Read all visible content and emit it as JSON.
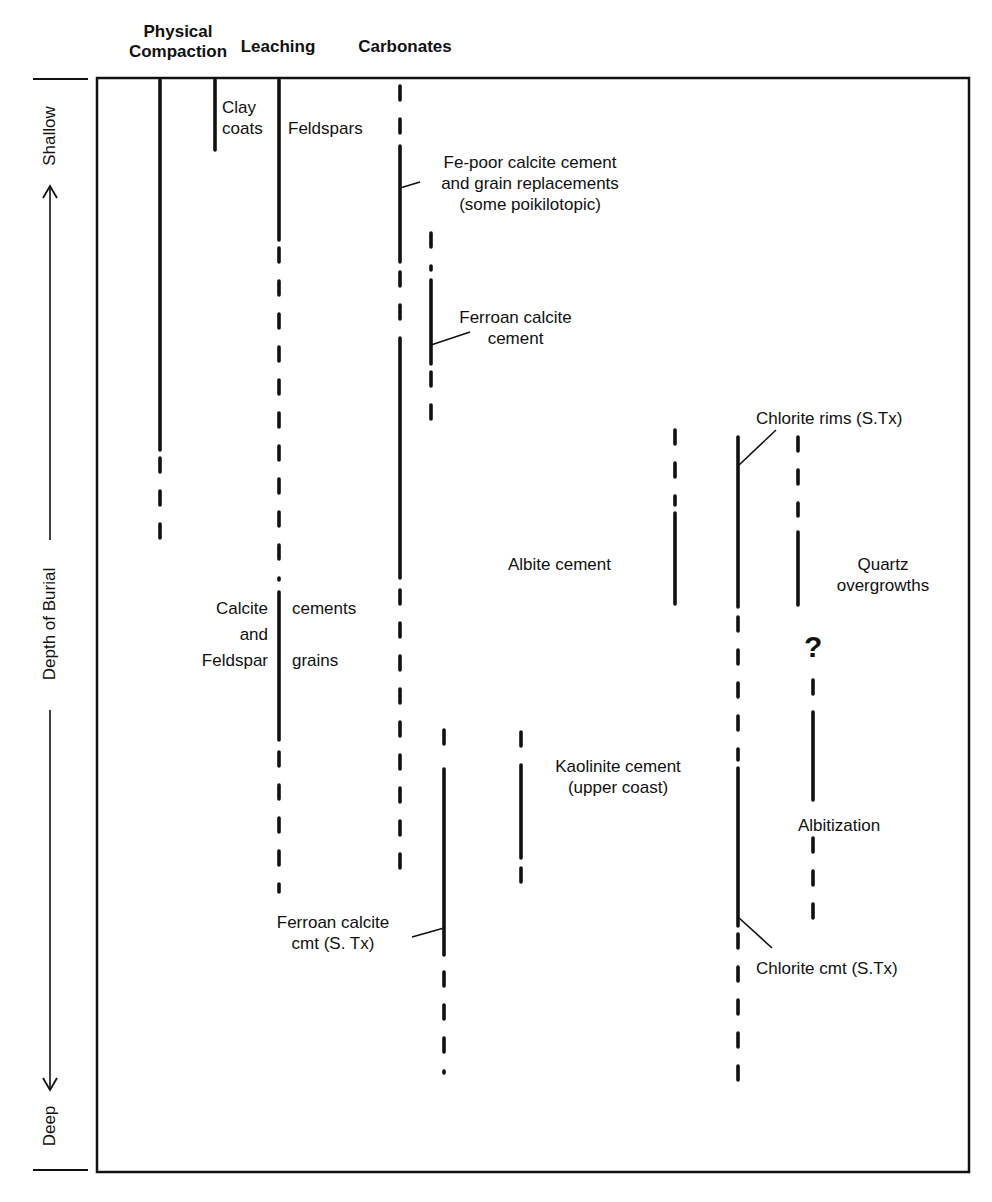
{
  "diagram": {
    "type": "diagenetic-sequence",
    "frame": {
      "x": 97,
      "y": 78,
      "width": 872,
      "height": 1094
    },
    "column_headers": [
      {
        "id": "physical-compaction",
        "lines": [
          "Physical",
          "Compaction"
        ],
        "x": 160
      },
      {
        "id": "leaching",
        "lines": [
          "Leaching"
        ],
        "x": 279
      },
      {
        "id": "carbonates",
        "lines": [
          "Carbonates"
        ],
        "x": 400
      }
    ],
    "axis": {
      "label": "Depth of Burial",
      "top_label": "Shallow",
      "bottom_label": "Deep",
      "direction": "increasing downward"
    },
    "labels": {
      "clay_coats": [
        "Clay",
        "coats"
      ],
      "feldspars": "Feldspars",
      "fe_poor_calcite": [
        "Fe-poor calcite cement",
        "and grain replacements",
        "(some poikilotopic)"
      ],
      "ferroan_calcite_cement": [
        "Ferroan calcite",
        "cement"
      ],
      "chlorite_rims": "Chlorite rims (S.Tx)",
      "albite_cement": "Albite cement",
      "quartz_overgrowths": [
        "Quartz",
        "overgrowths"
      ],
      "calcite_left": [
        "Calcite",
        "and",
        "Feldspar"
      ],
      "calcite_right": [
        "cements",
        "",
        "grains"
      ],
      "question_mark": "?",
      "kaolinite_cement": [
        "Kaolinite cement",
        "(upper coast)"
      ],
      "albitization": "Albitization",
      "ferroan_calcite_cmt": [
        "Ferroan calcite",
        "cmt (S. Tx)"
      ],
      "chlorite_cmt": "Chlorite cmt (S.Tx)"
    },
    "legend_convention": {
      "solid": "process well established",
      "dashed": "process uncertain / minor"
    },
    "processes": [
      {
        "name": "Physical Compaction",
        "x": 160,
        "segments": [
          {
            "y1": 80,
            "y2": 450,
            "style": "solid"
          },
          {
            "y1": 458,
            "y2": 548,
            "style": "dashed"
          }
        ]
      },
      {
        "name": "Clay coats",
        "x": 215,
        "segments": [
          {
            "y1": 80,
            "y2": 150,
            "style": "solid"
          }
        ]
      },
      {
        "name": "Leaching - Feldspars",
        "x": 279,
        "segments": [
          {
            "y1": 80,
            "y2": 240,
            "style": "solid"
          },
          {
            "y1": 248,
            "y2": 580,
            "style": "dashed"
          }
        ]
      },
      {
        "name": "Leaching - Calcite cements and Feldspar grains",
        "x": 279,
        "segments": [
          {
            "y1": 592,
            "y2": 740,
            "style": "solid"
          },
          {
            "y1": 752,
            "y2": 892,
            "style": "dashed"
          }
        ]
      },
      {
        "name": "Fe-poor calcite cement",
        "x": 400,
        "segments": [
          {
            "y1": 86,
            "y2": 136,
            "style": "dashed"
          },
          {
            "y1": 146,
            "y2": 262,
            "style": "solid"
          },
          {
            "y1": 272,
            "y2": 330,
            "style": "dashed"
          },
          {
            "y1": 338,
            "y2": 578,
            "style": "solid"
          },
          {
            "y1": 590,
            "y2": 886,
            "style": "dashed"
          }
        ]
      },
      {
        "name": "Ferroan calcite cement",
        "x": 431,
        "segments": [
          {
            "y1": 233,
            "y2": 270,
            "style": "dashed"
          },
          {
            "y1": 280,
            "y2": 364,
            "style": "solid"
          },
          {
            "y1": 372,
            "y2": 420,
            "style": "dashed"
          }
        ]
      },
      {
        "name": "Ferroan calcite cmt (S.Tx)",
        "x": 444,
        "segments": [
          {
            "y1": 730,
            "y2": 754,
            "style": "dashed"
          },
          {
            "y1": 769,
            "y2": 955,
            "style": "solid"
          },
          {
            "y1": 972,
            "y2": 1073,
            "style": "dashed"
          }
        ]
      },
      {
        "name": "Kaolinite cement",
        "x": 521,
        "segments": [
          {
            "y1": 732,
            "y2": 752,
            "style": "dashed"
          },
          {
            "y1": 765,
            "y2": 858,
            "style": "solid"
          },
          {
            "y1": 868,
            "y2": 890,
            "style": "dashed"
          }
        ]
      },
      {
        "name": "Albite cement",
        "x": 675,
        "segments": [
          {
            "y1": 430,
            "y2": 505,
            "style": "dashed"
          },
          {
            "y1": 513,
            "y2": 604,
            "style": "solid"
          }
        ]
      },
      {
        "name": "Chlorite rims / Chlorite cmt",
        "x": 738,
        "segments": [
          {
            "y1": 437,
            "y2": 607,
            "style": "solid"
          },
          {
            "y1": 617,
            "y2": 760,
            "style": "dashed"
          },
          {
            "y1": 768,
            "y2": 926,
            "style": "solid"
          },
          {
            "y1": 934,
            "y2": 1080,
            "style": "dashed"
          }
        ]
      },
      {
        "name": "Quartz overgrowths",
        "x": 798,
        "segments": [
          {
            "y1": 437,
            "y2": 516,
            "style": "dashed"
          },
          {
            "y1": 532,
            "y2": 605,
            "style": "solid"
          }
        ]
      },
      {
        "name": "Albitization",
        "x": 813,
        "segments": [
          {
            "y1": 680,
            "y2": 702,
            "style": "dashed"
          },
          {
            "y1": 712,
            "y2": 800,
            "style": "solid"
          },
          {
            "y1": 838,
            "y2": 920,
            "style": "dashed"
          }
        ]
      }
    ],
    "leaders": [
      {
        "for": "Fe-poor calcite",
        "x1": 400,
        "y1": 188,
        "x2": 420,
        "y2": 182
      },
      {
        "for": "Ferroan calcite cement",
        "x1": 431,
        "y1": 345,
        "x2": 470,
        "y2": 332
      },
      {
        "for": "Chlorite rims",
        "x1": 738,
        "y1": 466,
        "x2": 776,
        "y2": 430
      },
      {
        "for": "Ferroan calcite cmt",
        "x1": 444,
        "y1": 928,
        "x2": 412,
        "y2": 937
      },
      {
        "for": "Chlorite cmt",
        "x1": 738,
        "y1": 917,
        "x2": 772,
        "y2": 948
      }
    ]
  }
}
